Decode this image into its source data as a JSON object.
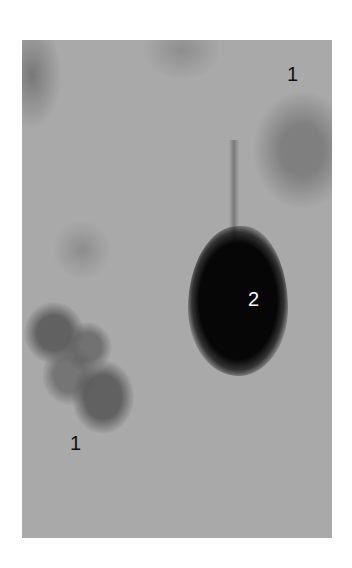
{
  "figure": {
    "type": "grayscale micrograph",
    "colors": {
      "background": "#a9a9a9",
      "dark_cell": "#060606",
      "label_dark": "#111111",
      "label_light": "#ffffff"
    },
    "labels": [
      {
        "id": "label-1-top-right",
        "text": "1"
      },
      {
        "id": "label-2-center",
        "text": "2"
      },
      {
        "id": "label-1-bottom-left",
        "text": "1"
      }
    ]
  }
}
